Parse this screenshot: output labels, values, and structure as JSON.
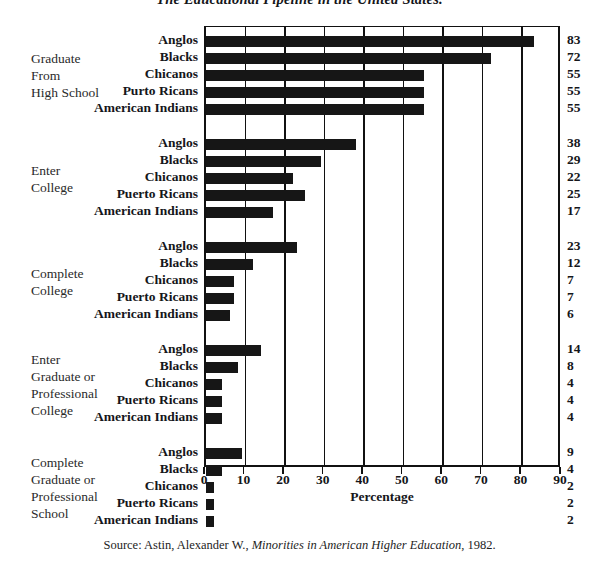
{
  "title": "The Educational Pipeline in the United States.",
  "source": {
    "prefix": "Source: Astin, Alexander W., ",
    "work": "Minorities in American Higher Education",
    "suffix": ", 1982."
  },
  "chart_data": {
    "type": "bar",
    "orientation": "horizontal",
    "title": "The Educational Pipeline in the United States.",
    "xlabel": "Percentage",
    "ylabel": "",
    "xlim": [
      0,
      90
    ],
    "xticks": [
      0,
      10,
      20,
      30,
      40,
      50,
      60,
      70,
      80,
      90
    ],
    "grid": true,
    "grid_axis": "x",
    "legend": "none",
    "value_labels": true,
    "categories": [
      "Anglos",
      "Blacks",
      "Chicanos",
      "Puerto Ricans",
      "American Indians"
    ],
    "groups": [
      {
        "caption_lines": [
          "Graduate",
          "From",
          "High School"
        ],
        "caption": "Graduate From High School",
        "labels": [
          "Anglos",
          "Blacks",
          "Chicanos",
          "Purto Ricans",
          "American Indians"
        ],
        "values": [
          83,
          72,
          55,
          55,
          55
        ]
      },
      {
        "caption_lines": [
          "Enter",
          "College"
        ],
        "caption": "Enter College",
        "labels": [
          "Anglos",
          "Blacks",
          "Chicanos",
          "Puerto Ricans",
          "American Indians"
        ],
        "values": [
          38,
          29,
          22,
          25,
          17
        ]
      },
      {
        "caption_lines": [
          "Complete",
          "College"
        ],
        "caption": "Complete College",
        "labels": [
          "Anglos",
          "Blacks",
          "Chicanos",
          "Puerto Ricans",
          "American Indians"
        ],
        "values": [
          23,
          12,
          7,
          7,
          6
        ]
      },
      {
        "caption_lines": [
          "Enter",
          "Graduate or",
          "Professional",
          "College"
        ],
        "caption": "Enter Graduate or Professional College",
        "labels": [
          "Anglos",
          "Blacks",
          "Chicanos",
          "Puerto Ricans",
          "American Indians"
        ],
        "values": [
          14,
          8,
          4,
          4,
          4
        ]
      },
      {
        "caption_lines": [
          "Complete",
          "Graduate or",
          "Professional",
          "School"
        ],
        "caption": "Complete Graduate or Professional School",
        "labels": [
          "Anglos",
          "Blacks",
          "Chicanos",
          "Puerto Ricans",
          "American Indians"
        ],
        "values": [
          9,
          4,
          2,
          2,
          2
        ]
      }
    ],
    "colors": {
      "bar": "#161616",
      "axis": "#111111",
      "background": "#ffffff",
      "text": "#15161a"
    }
  }
}
